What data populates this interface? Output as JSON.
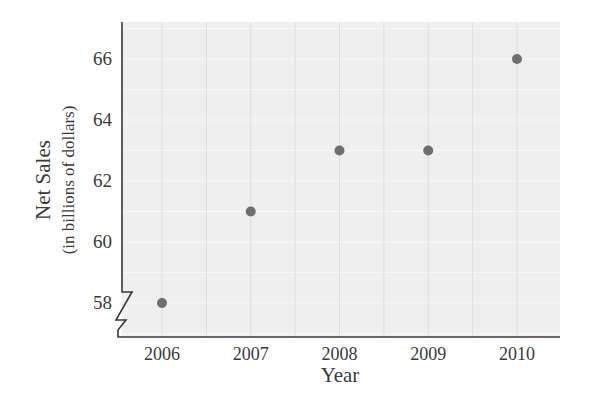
{
  "chart_data": {
    "type": "scatter",
    "title": "",
    "xlabel": "Year",
    "ylabel": "Net Sales",
    "ylabel_sub": "(in billions of dollars)",
    "categories": [
      "2006",
      "2007",
      "2008",
      "2009",
      "2010"
    ],
    "x": [
      2006,
      2007,
      2008,
      2009,
      2010
    ],
    "values": [
      58,
      61,
      63,
      63,
      66
    ],
    "series": [
      {
        "name": "Net Sales",
        "values": [
          58,
          61,
          63,
          63,
          66
        ]
      }
    ],
    "yticks": [
      58,
      60,
      62,
      64,
      66
    ],
    "xticks": [
      "2006",
      "2007",
      "2008",
      "2009",
      "2010"
    ],
    "ylim": [
      57,
      67
    ],
    "axis_break": "y",
    "grid": true,
    "legend": "none"
  },
  "colors": {
    "plot_background": "#efefef",
    "grid": "#dcdcdc",
    "grid_minor": "#f8f8f8",
    "point": "#6e6e6e",
    "axis": "#3a3a3a",
    "text": "#3a3a3a"
  }
}
